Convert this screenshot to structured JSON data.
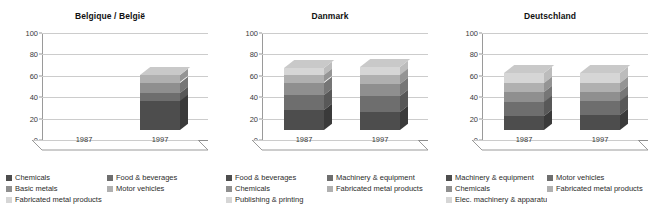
{
  "palette": {
    "s1": "#4d4d4d",
    "s2": "#6e6e6e",
    "s3": "#8f8f8f",
    "s4": "#b0b0b0",
    "s5": "#d6d6d6",
    "side_s1": "#3a3a3a",
    "side_s2": "#585858",
    "side_s3": "#767676",
    "side_s4": "#949494",
    "side_s5": "#bcbcbc",
    "top": "#c9c9c9",
    "grid": "#cccccc",
    "axis": "#8d8d8d",
    "background": "#ffffff",
    "text": "#2b2b2b"
  },
  "axis": {
    "ticks": [
      0,
      20,
      40,
      60,
      80,
      100
    ],
    "ymin": 0,
    "ymax": 100
  },
  "chart_data": [
    {
      "type": "bar",
      "stacked": true,
      "title": "Belgique / België",
      "xlabel": "",
      "ylabel": "",
      "ylim": [
        0,
        100
      ],
      "grid": true,
      "legend_position": "bottom",
      "categories": [
        "1987",
        "1997"
      ],
      "series": [
        {
          "name": "Chemicals",
          "values": [
            null,
            27
          ]
        },
        {
          "name": "Food & beverages",
          "values": [
            null,
            8
          ]
        },
        {
          "name": "Basic metals",
          "values": [
            null,
            9
          ]
        },
        {
          "name": "Motor vehicles",
          "values": [
            null,
            7
          ]
        },
        {
          "name": "Fabricated metal products",
          "values": [
            null,
            0
          ]
        }
      ],
      "totals": [
        null,
        51
      ],
      "legend": [
        "Chemicals",
        "Food & beverages",
        "Basic metals",
        "Motor vehicles",
        "Fabricated metal products"
      ]
    },
    {
      "type": "bar",
      "stacked": true,
      "title": "Danmark",
      "xlabel": "",
      "ylabel": "",
      "ylim": [
        0,
        100
      ],
      "grid": true,
      "legend_position": "bottom",
      "categories": [
        "1987",
        "1997"
      ],
      "series": [
        {
          "name": "Food & beverages",
          "values": [
            19,
            17
          ]
        },
        {
          "name": "Machinery & equipment",
          "values": [
            14,
            15
          ]
        },
        {
          "name": "Chemicals",
          "values": [
            11,
            11
          ]
        },
        {
          "name": "Fabricated metal products",
          "values": [
            7,
            8
          ]
        },
        {
          "name": "Publishing & printing",
          "values": [
            7,
            8
          ]
        }
      ],
      "totals": [
        58,
        59
      ],
      "legend": [
        "Food & beverages",
        "Machinery & equipment",
        "Chemicals",
        "Fabricated metal products",
        "Publishing & printing"
      ]
    },
    {
      "type": "bar",
      "stacked": true,
      "title": "Deutschland",
      "xlabel": "",
      "ylabel": "",
      "ylim": [
        0,
        100
      ],
      "grid": true,
      "legend_position": "bottom",
      "categories": [
        "1987",
        "1997"
      ],
      "series": [
        {
          "name": "Machinery & equipment",
          "values": [
            13,
            14
          ]
        },
        {
          "name": "Motor vehicles",
          "values": [
            13,
            13
          ]
        },
        {
          "name": "Chemicals",
          "values": [
            10,
            9
          ]
        },
        {
          "name": "Fabricated metal products",
          "values": [
            8,
            8
          ]
        },
        {
          "name": "Elec. machinery & apparatus",
          "values": [
            9,
            9
          ]
        }
      ],
      "totals": [
        53,
        53
      ],
      "legend": [
        "Machinery & equipment",
        "Motor vehicles",
        "Chemicals",
        "Fabricated metal products",
        "Elec. machinery & apparatus"
      ]
    }
  ]
}
